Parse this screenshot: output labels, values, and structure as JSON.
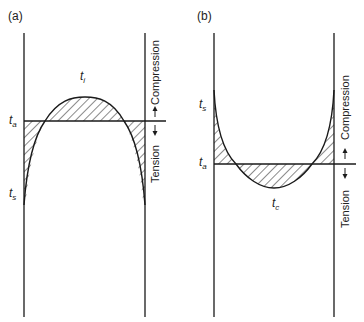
{
  "panels": [
    {
      "id": "a",
      "label": "(a)",
      "labels": {
        "ti": {
          "main": "t",
          "sub": "i"
        },
        "ta": {
          "main": "t",
          "sub": "a"
        },
        "ts": {
          "main": "t",
          "sub": "s"
        }
      },
      "compression_label": "Compression",
      "tension_label": "Tension",
      "description": "Stress profile with interior peak above t_a; hatched regions between curve and t_a"
    },
    {
      "id": "b",
      "label": "(b)",
      "labels": {
        "ts": {
          "main": "t",
          "sub": "s"
        },
        "ta": {
          "main": "t",
          "sub": "a"
        },
        "tc": {
          "main": "t",
          "sub": "c"
        }
      },
      "compression_label": "Compression",
      "tension_label": "Tension",
      "description": "U-shaped stress profile dipping below t_a at center; hatched regions between curve and t_a"
    }
  ],
  "colors": {
    "line": "#1a1a1a",
    "hatch": "#2a2a2a",
    "background": "#ffffff"
  }
}
